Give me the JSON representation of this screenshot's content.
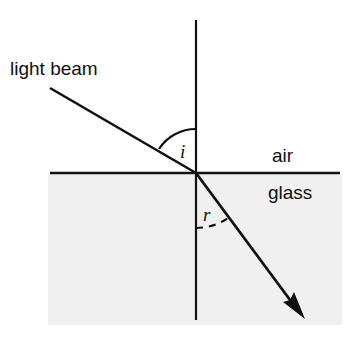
{
  "diagram": {
    "canvas": {
      "width": 356,
      "height": 349,
      "background": "#ffffff"
    },
    "labels": {
      "light_beam": "light beam",
      "air": "air",
      "glass": "glass",
      "angle_of_incidence": "i",
      "angle_of_refraction": "r"
    },
    "colors": {
      "ink": "#111111",
      "glass_fill": "#f0f0f0",
      "background": "#ffffff"
    },
    "geometry": {
      "incidence_point": {
        "x": 196,
        "y": 173
      },
      "interface_line": {
        "x1": 50,
        "y1": 173,
        "x2": 340,
        "y2": 173
      },
      "normal_line": {
        "x1": 196,
        "y1": 20,
        "x2": 196,
        "y2": 320
      },
      "incident_ray": {
        "x1": 50,
        "y1": 88,
        "x2": 196,
        "y2": 173
      },
      "refracted_ray": {
        "x1": 196,
        "y1": 173,
        "x2": 302,
        "y2": 316
      },
      "glass_region": {
        "x": 48,
        "y": 174,
        "width": 294,
        "height": 151
      },
      "arc_incidence": {
        "radius": 44,
        "style": "solid"
      },
      "arc_refraction": {
        "radius": 55,
        "style": "dashed"
      }
    }
  }
}
